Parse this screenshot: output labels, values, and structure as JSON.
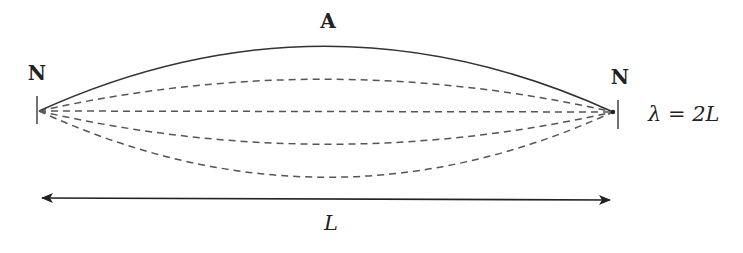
{
  "diagram": {
    "labels": {
      "left_node": "N",
      "right_node": "N",
      "antinode": "A",
      "length": "L",
      "wavelength_relation": "λ = 2L"
    },
    "nodes": [
      {
        "name": "left-node",
        "x": 39,
        "y": 111
      },
      {
        "name": "right-node",
        "x": 613,
        "y": 112
      }
    ],
    "curves": [
      {
        "name": "solid-envelope-top",
        "style": "solid",
        "offset": -65
      },
      {
        "name": "dashed-upper",
        "style": "dashed",
        "offset": -32
      },
      {
        "name": "dashed-middle",
        "style": "dashed",
        "offset": 0
      },
      {
        "name": "dashed-lower",
        "style": "dashed",
        "offset": 33
      },
      {
        "name": "dashed-bottom",
        "style": "dashed",
        "offset": 66
      }
    ],
    "colors": {
      "line": "#333333",
      "dash": "#555555",
      "text": "#222222"
    }
  }
}
